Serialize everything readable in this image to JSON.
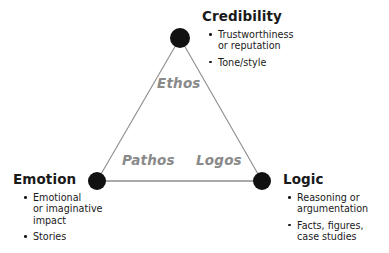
{
  "diagram": {
    "background_color": "#ffffff",
    "node_color": "#111111",
    "line_color": "#8c8c8c",
    "appeal_label_color": "#8a8a8a",
    "heading_color": "#1a1a1a"
  },
  "vertices": {
    "credibility": {
      "heading": "Credibility",
      "appeal": "Ethos",
      "bullets": [
        {
          "lines": [
            "Trustworthiness",
            "or reputation"
          ]
        },
        {
          "lines": [
            "Tone/style"
          ]
        }
      ]
    },
    "emotion": {
      "heading": "Emotion",
      "appeal": "Pathos",
      "bullets": [
        {
          "lines": [
            "Emotional",
            "or imaginative",
            "impact"
          ]
        },
        {
          "lines": [
            "Stories"
          ]
        }
      ]
    },
    "logic": {
      "heading": "Logic",
      "appeal": "Logos",
      "bullets": [
        {
          "lines": [
            "Reasoning or",
            "argumentation"
          ]
        },
        {
          "lines": [
            "Facts, figures,",
            "case studies"
          ]
        }
      ]
    }
  },
  "appeals": {
    "ethos": "Ethos",
    "pathos": "Pathos",
    "logos": "Logos"
  },
  "nodes": {
    "top": {
      "cx": 180,
      "cy": 38,
      "r": 10
    },
    "left": {
      "cx": 97,
      "cy": 181,
      "r": 9
    },
    "right": {
      "cx": 262,
      "cy": 181,
      "r": 9
    }
  }
}
